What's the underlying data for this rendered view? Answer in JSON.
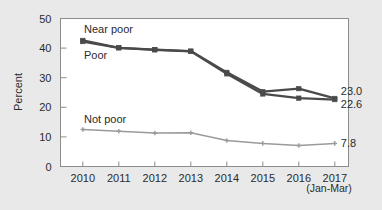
{
  "figure": {
    "background_color": "#e9e9e9",
    "plot_background_color": "#ffffff",
    "frame_color": "#8c8c8c"
  },
  "axes": {
    "y_title": "Percent",
    "y_ticks": [
      "0",
      "10",
      "20",
      "30",
      "40",
      "50"
    ],
    "x_ticks": [
      "2010",
      "2011",
      "2012",
      "2013",
      "2014",
      "2015",
      "2016",
      "2017"
    ],
    "x_sub_label": "(Jan-Mar)"
  },
  "series_labels": {
    "near_poor": "Near poor",
    "poor": "Poor",
    "not_poor": "Not poor"
  },
  "end_labels": {
    "near_poor": "23.0",
    "poor": "22.6",
    "not_poor": "7.8"
  },
  "colors": {
    "near_poor": "#4a4a4a",
    "poor": "#4a4a4a",
    "not_poor": "#9a9a9a"
  },
  "chart_data": {
    "type": "line",
    "title": "",
    "subtitle": "",
    "xlabel": "",
    "ylabel": "Percent",
    "categories": [
      "2010",
      "2011",
      "2012",
      "2013",
      "2014",
      "2015",
      "2016",
      "2017"
    ],
    "x_note": "2017 value covers January-March",
    "ylim": [
      0,
      50
    ],
    "ytick_step": 10,
    "grid": false,
    "legend": "inline-labels",
    "series": [
      {
        "name": "Near poor",
        "color": "#4a4a4a",
        "marker": "square",
        "values": [
          42.6,
          40.1,
          39.5,
          39.0,
          31.8,
          25.3,
          26.3,
          23.0
        ],
        "end_label": "23.0"
      },
      {
        "name": "Poor",
        "color": "#4a4a4a",
        "marker": "square",
        "values": [
          42.2,
          40.1,
          39.4,
          38.9,
          31.3,
          24.5,
          23.1,
          22.6
        ],
        "end_label": "22.6"
      },
      {
        "name": "Not poor",
        "color": "#9a9a9a",
        "marker": "plus",
        "values": [
          12.5,
          11.9,
          11.3,
          11.4,
          8.8,
          7.8,
          7.1,
          7.8
        ],
        "end_label": "7.8"
      }
    ]
  }
}
